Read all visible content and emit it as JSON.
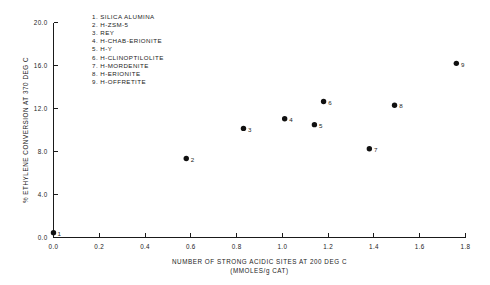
{
  "chart_data": {
    "type": "scatter",
    "title": "",
    "xlabel": "NUMBER OF STRONG ACIDIC SITES AT 200 DEG C",
    "xlabel_units": "(MMOLES/g CAT)",
    "ylabel": "% ETHYLENE CONVERSION AT 370 DEG C",
    "xlim": [
      0.0,
      1.8
    ],
    "ylim": [
      0.0,
      20.0
    ],
    "grid": false,
    "legend_position": "upper-left-inside",
    "xticks": [
      "0.0",
      "0.2",
      "0.4",
      "0.6",
      "0.8",
      "1.0",
      "1.2",
      "1.4",
      "1.6",
      "1.8"
    ],
    "xtick_values": [
      0.0,
      0.2,
      0.4,
      0.6,
      0.8,
      1.0,
      1.2,
      1.4,
      1.6,
      1.8
    ],
    "yticks": [
      "0.0",
      "4.0",
      "8.0",
      "12.0",
      "16.0",
      "20.0"
    ],
    "ytick_values": [
      0.0,
      4.0,
      8.0,
      12.0,
      16.0,
      20.0
    ],
    "points": [
      {
        "label": "1",
        "name": "SILICA ALUMINA",
        "x": 0.0,
        "y": 0.45,
        "label_dx": 4,
        "label_dy": 3.2
      },
      {
        "label": "2",
        "name": "H-ZSM-5",
        "x": 0.58,
        "y": 7.35,
        "label_dx": 4.6,
        "label_dy": 3.2
      },
      {
        "label": "3",
        "name": "REY",
        "x": 0.83,
        "y": 10.15,
        "label_dx": 4.6,
        "label_dy": 3.2
      },
      {
        "label": "4",
        "name": "H-CHAB-ERIONITE",
        "x": 1.01,
        "y": 11.05,
        "label_dx": 4.6,
        "label_dy": 3.2
      },
      {
        "label": "5",
        "name": "H-Y",
        "x": 1.14,
        "y": 10.5,
        "label_dx": 4.6,
        "label_dy": 3.2
      },
      {
        "label": "6",
        "name": "H-CLINOPTILOLITE",
        "x": 1.18,
        "y": 12.65,
        "label_dx": 4.6,
        "label_dy": 3.2
      },
      {
        "label": "7",
        "name": "H-MORDENITE",
        "x": 1.38,
        "y": 8.25,
        "label_dx": 4.6,
        "label_dy": 3.2
      },
      {
        "label": "8",
        "name": "H-ERIONITE",
        "x": 1.49,
        "y": 12.3,
        "label_dx": 4.6,
        "label_dy": 3.2
      },
      {
        "label": "9",
        "name": "H-OFFRETITE",
        "x": 1.76,
        "y": 16.2,
        "label_dx": 4.6,
        "label_dy": 3.2
      }
    ],
    "legend_entries": [
      "1. SILICA ALUMINA",
      "2. H-ZSM-5",
      "3. REY",
      "4. H-CHAB-ERIONITE",
      "5. H-Y",
      "6. H-CLINOPTILOLITE",
      "7. H-MORDENITE",
      "8. H-ERIONITE",
      "9. H-OFFRETITE"
    ],
    "colors": {
      "marker": "#111111",
      "axis": "#1a1a1a",
      "text": "#232323",
      "background": "#ffffff"
    }
  }
}
